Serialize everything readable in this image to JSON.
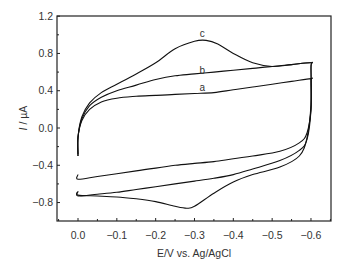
{
  "chart_data": {
    "type": "line",
    "title": "",
    "xlabel": "E/V vs. Ag/AgCl",
    "ylabel": "I / µA",
    "ylabel_italic_part": "I",
    "ylabel_rest": " / µA",
    "xlim": [
      0.05,
      -0.65
    ],
    "ylim": [
      -1.0,
      1.2
    ],
    "x_ticks": [
      0.0,
      -0.1,
      -0.2,
      -0.3,
      -0.4,
      -0.5,
      -0.6
    ],
    "x_tick_labels": [
      "0.0",
      "−0.1",
      "−0.2",
      "−0.3",
      "−0.4",
      "−0.5",
      "−0.6"
    ],
    "y_ticks": [
      1.2,
      0.8,
      0.4,
      0.0,
      -0.4,
      -0.8
    ],
    "y_tick_labels": [
      "1.2",
      "0.8",
      "0.4",
      "0.0",
      "−0.4",
      "−0.8"
    ],
    "grid": false,
    "legend": "inline curve labels",
    "series": [
      {
        "name": "a",
        "label_pos": [
          -0.32,
          0.4
        ],
        "x": [
          0.0,
          0.0,
          -0.01,
          -0.03,
          -0.06,
          -0.1,
          -0.15,
          -0.2,
          -0.25,
          -0.3,
          -0.35,
          -0.4,
          -0.45,
          -0.5,
          -0.55,
          -0.6,
          -0.6,
          -0.6,
          -0.59,
          -0.57,
          -0.52,
          -0.45,
          -0.4,
          -0.35,
          -0.3,
          -0.25,
          -0.2,
          -0.15,
          -0.1,
          -0.05,
          0.0,
          0.0
        ],
        "y": [
          -0.28,
          -0.1,
          0.08,
          0.2,
          0.28,
          0.32,
          0.34,
          0.35,
          0.36,
          0.37,
          0.38,
          0.41,
          0.44,
          0.47,
          0.5,
          0.53,
          0.5,
          0.2,
          -0.05,
          -0.16,
          -0.25,
          -0.3,
          -0.33,
          -0.36,
          -0.38,
          -0.4,
          -0.43,
          -0.46,
          -0.49,
          -0.52,
          -0.55,
          -0.5
        ]
      },
      {
        "name": "b",
        "label_pos": [
          -0.32,
          0.58
        ],
        "x": [
          0.0,
          0.0,
          -0.01,
          -0.03,
          -0.06,
          -0.1,
          -0.15,
          -0.2,
          -0.25,
          -0.3,
          -0.35,
          -0.4,
          -0.45,
          -0.5,
          -0.55,
          -0.6,
          -0.6,
          -0.6,
          -0.59,
          -0.57,
          -0.52,
          -0.45,
          -0.4,
          -0.35,
          -0.3,
          -0.25,
          -0.2,
          -0.15,
          -0.1,
          -0.05,
          0.0,
          0.0
        ],
        "y": [
          -0.3,
          -0.1,
          0.1,
          0.24,
          0.33,
          0.4,
          0.46,
          0.52,
          0.56,
          0.58,
          0.6,
          0.62,
          0.64,
          0.66,
          0.68,
          0.7,
          0.65,
          0.2,
          -0.12,
          -0.24,
          -0.35,
          -0.44,
          -0.5,
          -0.54,
          -0.57,
          -0.6,
          -0.63,
          -0.66,
          -0.69,
          -0.71,
          -0.73,
          -0.68
        ]
      },
      {
        "name": "c",
        "label_pos": [
          -0.32,
          0.98
        ],
        "x": [
          0.0,
          0.0,
          -0.01,
          -0.03,
          -0.06,
          -0.1,
          -0.15,
          -0.2,
          -0.25,
          -0.3,
          -0.33,
          -0.36,
          -0.4,
          -0.45,
          -0.5,
          -0.55,
          -0.6,
          -0.6,
          -0.6,
          -0.59,
          -0.57,
          -0.52,
          -0.45,
          -0.4,
          -0.35,
          -0.3,
          -0.28,
          -0.25,
          -0.2,
          -0.15,
          -0.1,
          -0.05,
          0.0,
          0.0
        ],
        "y": [
          -0.3,
          -0.1,
          0.12,
          0.27,
          0.38,
          0.47,
          0.58,
          0.7,
          0.85,
          0.93,
          0.94,
          0.9,
          0.8,
          0.7,
          0.66,
          0.68,
          0.7,
          0.65,
          0.25,
          -0.1,
          -0.3,
          -0.42,
          -0.5,
          -0.58,
          -0.7,
          -0.84,
          -0.86,
          -0.84,
          -0.79,
          -0.76,
          -0.74,
          -0.73,
          -0.72,
          -0.68
        ]
      }
    ]
  },
  "layout": {
    "plot_left": 57,
    "plot_right": 331,
    "plot_top": 16,
    "plot_bottom": 221,
    "x0_px": 78,
    "x_per_unit_px": -388.3,
    "y0_px": 128,
    "y_per_unit_px": -93.2,
    "line_color": "#111111",
    "axis_color": "#222222"
  }
}
